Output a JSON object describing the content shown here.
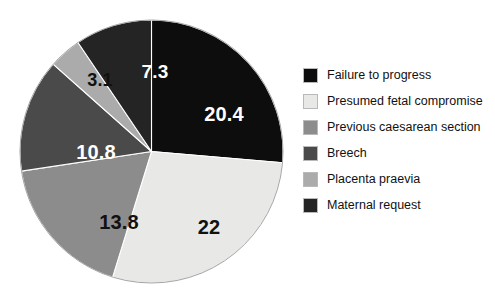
{
  "chart_data": {
    "type": "pie",
    "title": "",
    "subtitle": "",
    "xlabel": "",
    "ylabel": "",
    "legend_position": "right",
    "grid": false,
    "value_unit": "%",
    "categories": [
      "Failure to progress",
      "Presumed fetal compromise",
      "Previous caesarean section",
      "Breech",
      "Placenta praevia",
      "Maternal request"
    ],
    "values": [
      20.4,
      22,
      13.8,
      10.8,
      3.1,
      7.3
    ],
    "labels": [
      "20.4",
      "22",
      "13.8",
      "10.8",
      "3.1",
      "7.3"
    ],
    "colors": [
      "#0d0d0d",
      "#e8e8e6",
      "#8c8c8c",
      "#4a4a4a",
      "#ababab",
      "#242424"
    ],
    "label_text_colors": [
      "#ffffff",
      "#111111",
      "#111111",
      "#ffffff",
      "#111111",
      "#ffffff"
    ],
    "slices": [
      {
        "name": "Failure to progress",
        "value": 20.4,
        "label": "20.4",
        "color": "#0d0d0d",
        "start_angle": 0,
        "end_angle": 94.9,
        "label_on": "dark"
      },
      {
        "name": "Presumed fetal compromise",
        "value": 22,
        "label": "22",
        "color": "#e8e8e6",
        "start_angle": 94.9,
        "end_angle": 197.2,
        "label_on": "light"
      },
      {
        "name": "Previous caesarean section",
        "value": 13.8,
        "label": "13.8",
        "color": "#8c8c8c",
        "start_angle": 197.2,
        "end_angle": 261.4,
        "label_on": "light"
      },
      {
        "name": "Breech",
        "value": 10.8,
        "label": "10.8",
        "color": "#4a4a4a",
        "start_angle": 261.4,
        "end_angle": 311.6,
        "label_on": "dark"
      },
      {
        "name": "Placenta praevia",
        "value": 3.1,
        "label": "3.1",
        "color": "#ababab",
        "start_angle": 311.6,
        "end_angle": 326.0,
        "label_on": "light"
      },
      {
        "name": "Maternal request",
        "value": 7.3,
        "label": "7.3",
        "color": "#242424",
        "start_angle": 326.0,
        "end_angle": 360,
        "label_on": "dark"
      }
    ]
  },
  "legend": {
    "items": [
      {
        "label": "Failure to progress",
        "color": "#0d0d0d"
      },
      {
        "label": "Presumed fetal compromise",
        "color": "#e8e8e6"
      },
      {
        "label": "Previous caesarean section",
        "color": "#8c8c8c"
      },
      {
        "label": "Breech",
        "color": "#4a4a4a"
      },
      {
        "label": "Placenta praevia",
        "color": "#ababab"
      },
      {
        "label": "Maternal request",
        "color": "#242424"
      }
    ]
  }
}
